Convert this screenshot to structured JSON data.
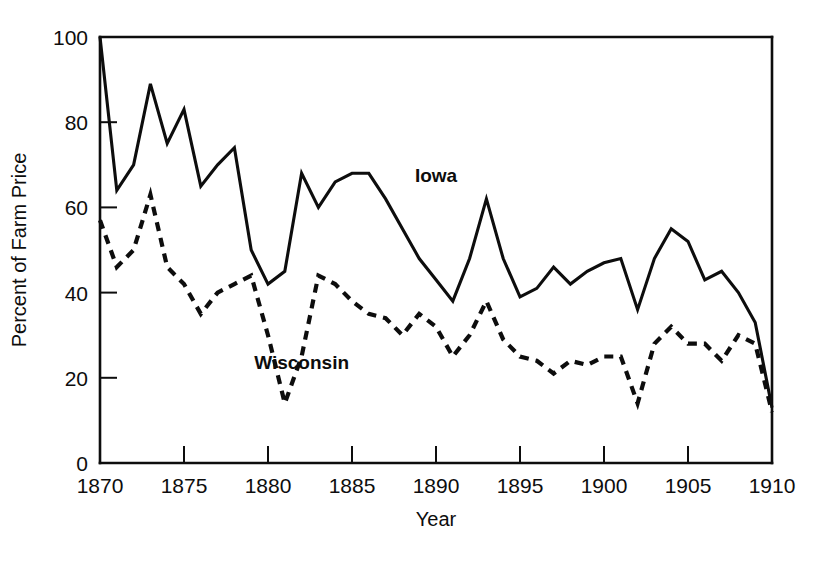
{
  "chart_data": {
    "type": "line",
    "title": "",
    "subtitle": "",
    "xlabel": "Year",
    "ylabel": "Percent of Farm Price",
    "xlim": [
      1870,
      1910
    ],
    "ylim": [
      0,
      100
    ],
    "xticks": [
      1870,
      1875,
      1880,
      1885,
      1890,
      1895,
      1900,
      1905,
      1910
    ],
    "xticklabels": [
      "1870",
      "1875",
      "1880",
      "1885",
      "1890",
      "1895",
      "1900",
      "1905",
      "1910"
    ],
    "yticks": [
      0,
      20,
      40,
      60,
      80,
      100
    ],
    "yticklabels": [
      "0",
      "20",
      "40",
      "60",
      "80",
      "100"
    ],
    "grid": false,
    "legend_position": "inline-annotation",
    "x": [
      1870,
      1871,
      1872,
      1873,
      1874,
      1875,
      1876,
      1877,
      1878,
      1879,
      1880,
      1881,
      1882,
      1883,
      1884,
      1885,
      1886,
      1887,
      1888,
      1889,
      1890,
      1891,
      1892,
      1893,
      1894,
      1895,
      1896,
      1897,
      1898,
      1899,
      1900,
      1901,
      1902,
      1903,
      1904,
      1905,
      1906,
      1907,
      1908,
      1909,
      1910
    ],
    "series": [
      {
        "name": "Iowa",
        "style": "solid",
        "color": "#0d0d0d",
        "label_x": 1890,
        "label_y": 66,
        "values": [
          100,
          64,
          70,
          89,
          75,
          83,
          65,
          70,
          74,
          50,
          42,
          45,
          68,
          60,
          66,
          68,
          68,
          62,
          55,
          48,
          43,
          38,
          48,
          62,
          48,
          39,
          41,
          46,
          42,
          45,
          47,
          48,
          36,
          48,
          55,
          52,
          43,
          45,
          40,
          33,
          13
        ]
      },
      {
        "name": "Wisconsin",
        "style": "dashed",
        "color": "#0d0d0d",
        "label_x": 1882,
        "label_y": 22,
        "values": [
          57,
          46,
          50,
          63,
          46,
          42,
          35,
          40,
          42,
          44,
          30,
          14,
          25,
          44,
          42,
          38,
          35,
          34,
          30,
          35,
          32,
          25,
          30,
          38,
          29,
          25,
          24,
          21,
          24,
          23,
          25,
          25,
          14,
          28,
          32,
          28,
          28,
          24,
          30,
          28,
          12
        ]
      }
    ]
  }
}
